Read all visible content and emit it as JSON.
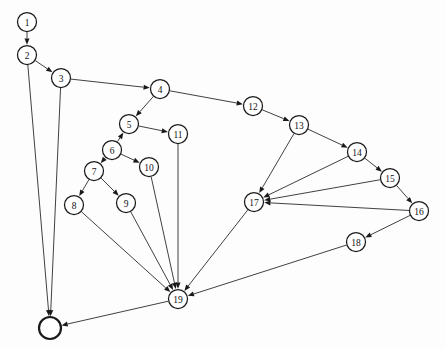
{
  "diagram": {
    "type": "directed-graph",
    "width": 445,
    "height": 349,
    "background_color": "#fdfdfd",
    "node_fill_color": "#ffffff",
    "node_stroke_color": "#1a1a1a",
    "edge_color": "#2b2b2b",
    "node_radius": 9.5,
    "terminal_node_radius": 11,
    "nodes": [
      {
        "id": "n1",
        "label": "1",
        "x": 27,
        "y": 22,
        "r": 9.5,
        "terminal": false
      },
      {
        "id": "n2",
        "label": "2",
        "x": 27,
        "y": 55,
        "r": 9.5,
        "terminal": false
      },
      {
        "id": "n3",
        "label": "3",
        "x": 61,
        "y": 78,
        "r": 9.5,
        "terminal": false
      },
      {
        "id": "n4",
        "label": "4",
        "x": 160,
        "y": 89,
        "r": 9.5,
        "terminal": false
      },
      {
        "id": "n5",
        "label": "5",
        "x": 129,
        "y": 124,
        "r": 9.5,
        "terminal": false
      },
      {
        "id": "n6",
        "label": "6",
        "x": 112,
        "y": 150,
        "r": 9.5,
        "terminal": false
      },
      {
        "id": "n7",
        "label": "7",
        "x": 94,
        "y": 171,
        "r": 9.5,
        "terminal": false
      },
      {
        "id": "n8",
        "label": "8",
        "x": 74,
        "y": 205,
        "r": 9.5,
        "terminal": false
      },
      {
        "id": "n9",
        "label": "9",
        "x": 126,
        "y": 203,
        "r": 9.5,
        "terminal": false
      },
      {
        "id": "n10",
        "label": "10",
        "x": 149,
        "y": 167,
        "r": 9.5,
        "terminal": false
      },
      {
        "id": "n11",
        "label": "11",
        "x": 178,
        "y": 134,
        "r": 9.5,
        "terminal": false
      },
      {
        "id": "n12",
        "label": "12",
        "x": 253,
        "y": 106,
        "r": 9.5,
        "terminal": false
      },
      {
        "id": "n13",
        "label": "13",
        "x": 299,
        "y": 125,
        "r": 9.5,
        "terminal": false
      },
      {
        "id": "n14",
        "label": "14",
        "x": 357,
        "y": 152,
        "r": 9.5,
        "terminal": false
      },
      {
        "id": "n15",
        "label": "15",
        "x": 390,
        "y": 178,
        "r": 9.5,
        "terminal": false
      },
      {
        "id": "n16",
        "label": "16",
        "x": 419,
        "y": 211,
        "r": 9.5,
        "terminal": false
      },
      {
        "id": "n17",
        "label": "17",
        "x": 254,
        "y": 202,
        "r": 9.5,
        "terminal": false
      },
      {
        "id": "n18",
        "label": "18",
        "x": 356,
        "y": 242,
        "r": 9.5,
        "terminal": false
      },
      {
        "id": "n19",
        "label": "19",
        "x": 178,
        "y": 299,
        "r": 9.5,
        "terminal": false
      },
      {
        "id": "nT",
        "label": "",
        "x": 50,
        "y": 328,
        "r": 11,
        "terminal": true
      }
    ],
    "edges": [
      {
        "from": "n1",
        "to": "n2"
      },
      {
        "from": "n2",
        "to": "n3"
      },
      {
        "from": "n2",
        "to": "nT"
      },
      {
        "from": "n3",
        "to": "n4"
      },
      {
        "from": "n3",
        "to": "nT"
      },
      {
        "from": "n4",
        "to": "n5"
      },
      {
        "from": "n4",
        "to": "n12"
      },
      {
        "from": "n5",
        "to": "n11"
      },
      {
        "from": "n6",
        "to": "n5"
      },
      {
        "from": "n6",
        "to": "n7"
      },
      {
        "from": "n6",
        "to": "n10"
      },
      {
        "from": "n7",
        "to": "n8"
      },
      {
        "from": "n7",
        "to": "n9"
      },
      {
        "from": "n8",
        "to": "n19"
      },
      {
        "from": "n9",
        "to": "n19"
      },
      {
        "from": "n10",
        "to": "n19"
      },
      {
        "from": "n11",
        "to": "n19"
      },
      {
        "from": "n12",
        "to": "n13"
      },
      {
        "from": "n13",
        "to": "n14"
      },
      {
        "from": "n13",
        "to": "n17"
      },
      {
        "from": "n14",
        "to": "n15"
      },
      {
        "from": "n14",
        "to": "n17"
      },
      {
        "from": "n15",
        "to": "n16"
      },
      {
        "from": "n15",
        "to": "n17"
      },
      {
        "from": "n16",
        "to": "n17"
      },
      {
        "from": "n16",
        "to": "n18"
      },
      {
        "from": "n17",
        "to": "n19"
      },
      {
        "from": "n18",
        "to": "n19"
      },
      {
        "from": "n19",
        "to": "nT"
      }
    ]
  }
}
